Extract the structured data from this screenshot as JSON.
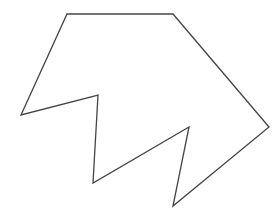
{
  "diagram": {
    "width": 280,
    "height": 213,
    "background": "#ffffff",
    "shapes": [
      {
        "type": "polygon",
        "name": "irregular-polygon",
        "stroke": "#444444",
        "stroke_width": 1.3,
        "fill": "none",
        "points": [
          [
            67,
            14
          ],
          [
            173,
            14
          ],
          [
            269,
            127
          ],
          [
            173,
            206
          ],
          [
            189,
            127
          ],
          [
            93,
            183
          ],
          [
            98,
            95
          ],
          [
            21,
            115
          ]
        ]
      }
    ]
  }
}
